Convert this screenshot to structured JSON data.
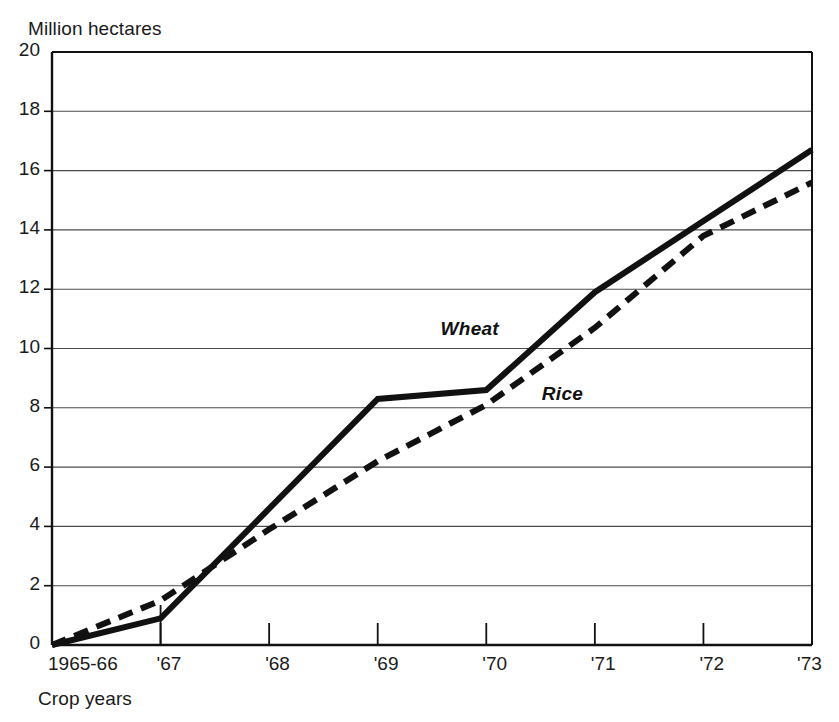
{
  "chart_data": {
    "type": "line",
    "title": "",
    "unit_label": "Million hectares",
    "xlabel": "Crop years",
    "ylabel": "",
    "categories": [
      "1965-66",
      "'67",
      "'68",
      "'69",
      "'70",
      "'71",
      "'72",
      "'73"
    ],
    "x_tick_labels": [
      "1965-66",
      "'67",
      "'68",
      "'69",
      "'70",
      "'71",
      "'72",
      "'73"
    ],
    "y_tick_labels": [
      "0",
      "2",
      "4",
      "6",
      "8",
      "10",
      "12",
      "14",
      "16",
      "18",
      "20"
    ],
    "y_ticks": [
      0,
      2,
      4,
      6,
      8,
      10,
      12,
      14,
      16,
      18,
      20
    ],
    "ylim": [
      0,
      20
    ],
    "xlim": [
      0,
      7
    ],
    "grid": "horizontal",
    "legend_position": "inline-annotation",
    "series": [
      {
        "name": "Wheat",
        "style": "solid",
        "color": "#111111",
        "label_x_value": 3.85,
        "label_y_value": 10.6,
        "values": [
          0.0,
          0.9,
          4.6,
          8.3,
          8.6,
          11.9,
          14.3,
          16.7
        ]
      },
      {
        "name": "Rice",
        "style": "dashed",
        "color": "#111111",
        "label_x_value": 4.7,
        "label_y_value": 8.4,
        "values": [
          0.0,
          1.5,
          3.9,
          6.2,
          8.1,
          10.7,
          13.8,
          15.6
        ]
      }
    ],
    "annotations": [
      {
        "text": "Wheat",
        "x": 3.85,
        "y": 10.6
      },
      {
        "text": "Rice",
        "x": 4.7,
        "y": 8.4
      }
    ],
    "axis_color": "#111111",
    "grid_color": "#4a4a4a",
    "background_color": "#ffffff"
  },
  "plot_geometry": {
    "left": 52,
    "right": 812,
    "top": 52,
    "bottom": 645
  }
}
